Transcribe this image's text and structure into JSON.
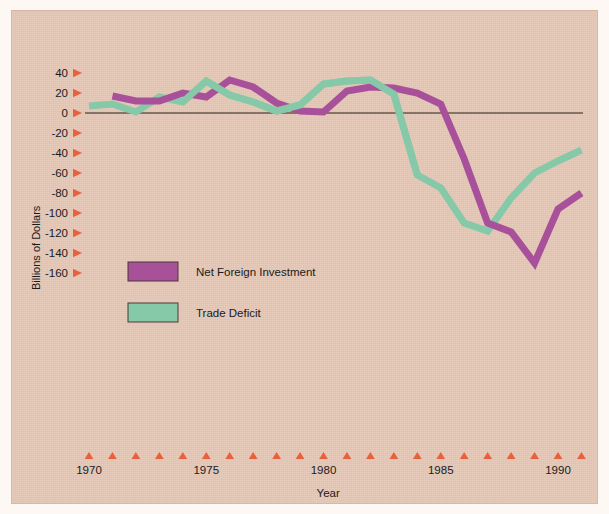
{
  "chart_data": {
    "type": "line",
    "title": "",
    "xlabel": "Year",
    "ylabel": "Billions of Dollars",
    "xlim": [
      1970,
      1991
    ],
    "ylim": [
      -160,
      40
    ],
    "yticks": [
      40,
      20,
      0,
      -20,
      -40,
      -60,
      -80,
      -100,
      -120,
      -140,
      -160
    ],
    "ytick_labels": [
      "40",
      "20",
      "0",
      "-20",
      "-40",
      "-60",
      "-80",
      "-100",
      "-120",
      "-140",
      "-160"
    ],
    "xticks": [
      1970,
      1971,
      1972,
      1973,
      1974,
      1975,
      1976,
      1977,
      1978,
      1979,
      1980,
      1981,
      1982,
      1983,
      1984,
      1985,
      1986,
      1987,
      1988,
      1989,
      1990,
      1991
    ],
    "xtick_labels_shown": [
      "1970",
      "1975",
      "1980",
      "1985",
      "1990"
    ],
    "xtick_labels_shown_at": [
      1970,
      1975,
      1980,
      1985,
      1990
    ],
    "grid": false,
    "legend_position": "center-left",
    "zero_line": 0,
    "series": [
      {
        "name": "Net Foreign Investment",
        "color": "#a8519a",
        "x": [
          1971,
          1972,
          1973,
          1974,
          1975,
          1976,
          1977,
          1978,
          1979,
          1980,
          1981,
          1982,
          1983,
          1984,
          1985,
          1986,
          1987,
          1988,
          1989,
          1990,
          1991
        ],
        "values": [
          17,
          12,
          12,
          20,
          16,
          33,
          26,
          10,
          2,
          1,
          22,
          26,
          25,
          20,
          9,
          -46,
          -110,
          -119,
          -150,
          -96,
          -80
        ]
      },
      {
        "name": "Trade Deficit",
        "color": "#86c9a9",
        "x": [
          1970,
          1971,
          1972,
          1973,
          1974,
          1975,
          1976,
          1977,
          1978,
          1979,
          1980,
          1981,
          1982,
          1983,
          1984,
          1985,
          1986,
          1987,
          1988,
          1989,
          1990,
          1991
        ],
        "values": [
          7,
          9,
          1,
          16,
          11,
          32,
          18,
          11,
          2,
          8,
          29,
          32,
          33,
          19,
          -62,
          -75,
          -110,
          -118,
          -85,
          -60,
          -48,
          -37
        ]
      }
    ]
  },
  "legend": {
    "items": [
      {
        "label": "Net Foreign Investment",
        "color": "#a8519a"
      },
      {
        "label": "Trade Deficit",
        "color": "#86c9a9"
      }
    ]
  },
  "axes": {
    "y_title": "Billions of Dollars",
    "x_title": "Year"
  }
}
